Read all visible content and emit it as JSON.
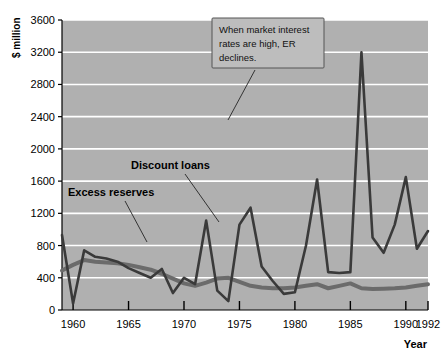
{
  "chart_data": {
    "type": "line",
    "title": "",
    "xlabel": "Year",
    "ylabel": "$ million",
    "xlim": [
      1959,
      1992
    ],
    "ylim": [
      0,
      3600
    ],
    "grid": true,
    "gridlines_y": [
      0,
      400,
      800,
      1200,
      1600,
      2000,
      2400,
      2800,
      3200,
      3600
    ],
    "ytick_labels": [
      "0",
      "400",
      "800",
      "1200",
      "1600",
      "2000",
      "2400",
      "2800",
      "3200",
      "3600"
    ],
    "xtick_values": [
      1960,
      1965,
      1970,
      1975,
      1980,
      1985,
      1990,
      1992
    ],
    "xtick_labels": [
      "1960",
      "1965",
      "1970",
      "1975",
      "1980",
      "1985",
      "1990",
      "1992"
    ],
    "legend_position": "inline-labels",
    "plot_background": "#b0b0b0",
    "gridline_color": "#ffffff",
    "x": [
      1959,
      1960,
      1961,
      1962,
      1963,
      1964,
      1965,
      1966,
      1967,
      1968,
      1969,
      1970,
      1971,
      1972,
      1973,
      1974,
      1975,
      1976,
      1977,
      1978,
      1979,
      1980,
      1981,
      1982,
      1983,
      1984,
      1985,
      1986,
      1987,
      1988,
      1989,
      1990,
      1991,
      1992
    ],
    "series": [
      {
        "name": "Excess reserves",
        "color": "#6b6b6b",
        "width": 4,
        "values": [
          490,
          560,
          620,
          600,
          590,
          580,
          560,
          530,
          500,
          450,
          390,
          330,
          300,
          340,
          390,
          400,
          350,
          300,
          280,
          270,
          270,
          280,
          300,
          320,
          270,
          300,
          330,
          270,
          260,
          265,
          270,
          280,
          300,
          320
        ]
      },
      {
        "name": "Discount loans",
        "color": "#3a3a3a",
        "width": 2.6,
        "values": [
          930,
          80,
          740,
          660,
          640,
          600,
          520,
          460,
          400,
          510,
          210,
          400,
          320,
          1110,
          240,
          110,
          1060,
          1270,
          540,
          360,
          200,
          220,
          800,
          1620,
          470,
          460,
          470,
          3200,
          900,
          710,
          1060,
          1650,
          760,
          980
        ]
      }
    ],
    "series_label_positions": [
      {
        "name": "Excess reserves",
        "label_x": 68,
        "label_y": 196
      },
      {
        "name": "Discount loans",
        "label_x": 131,
        "label_y": 169
      }
    ],
    "annotation": {
      "text_lines": [
        "When market interest",
        "rates are high, ER",
        "declines."
      ],
      "box_fill": "#bdbdbd",
      "box_stroke": "#555555"
    }
  },
  "axes": {
    "y_axis_title": "$ million",
    "x_axis_title": "Year"
  }
}
